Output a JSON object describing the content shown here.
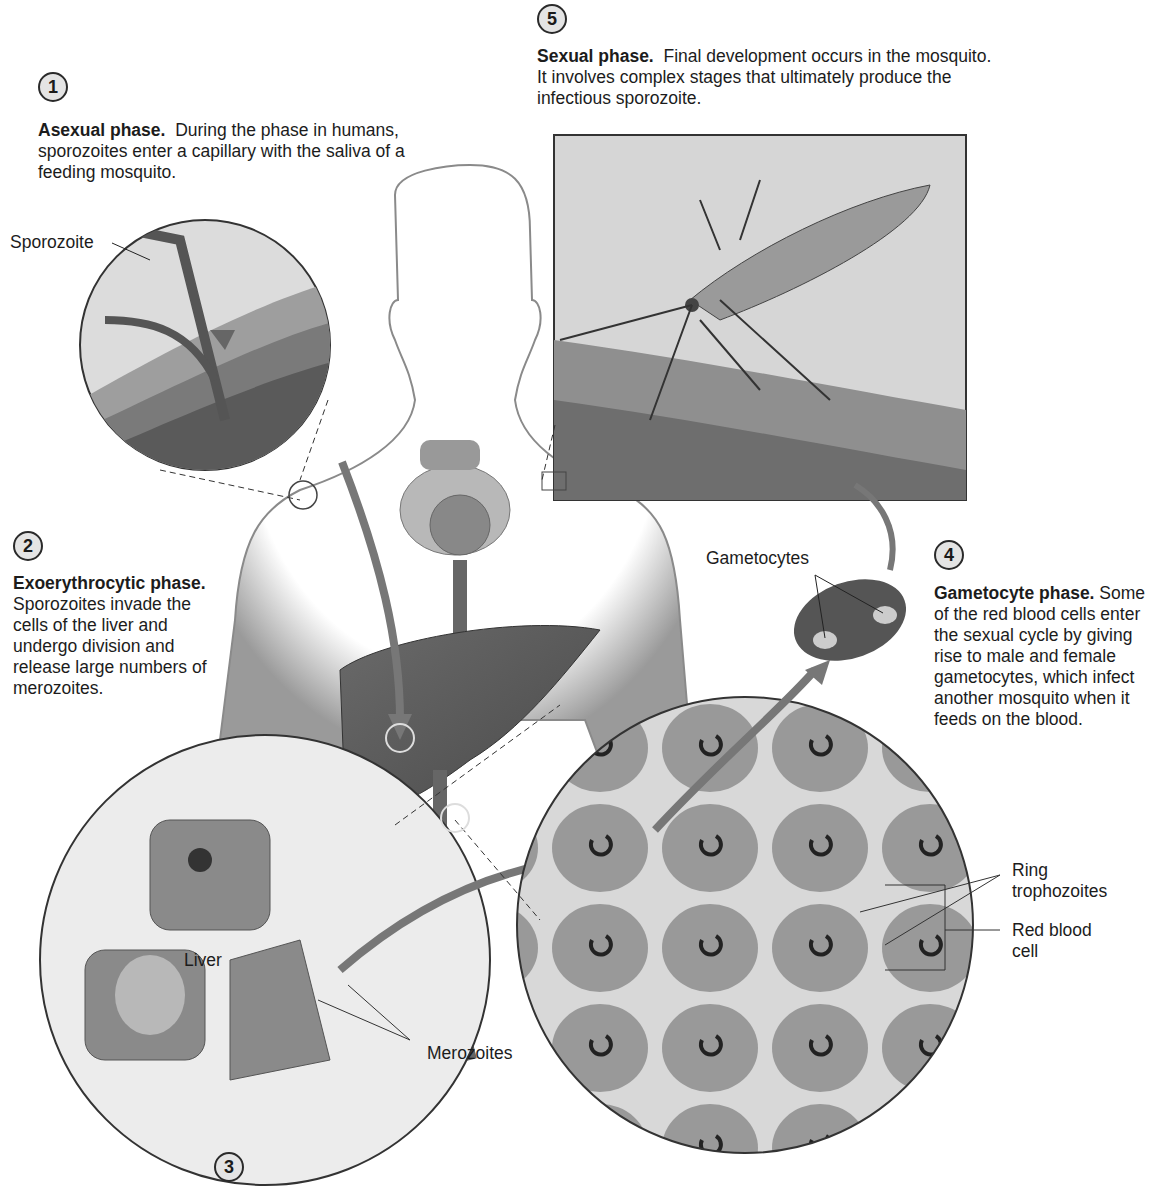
{
  "figure": {
    "steps": [
      {
        "number": "1",
        "heading": "Asexual phase.",
        "text": "During the phase in humans, sporozoites enter a capillary with the saliva of a feeding mosquito."
      },
      {
        "number": "2",
        "heading": "Exoerythrocytic phase.",
        "text": "Sporozoites invade the cells of the liver and undergo division and release large numbers of merozoites."
      },
      {
        "number": "3",
        "heading": "",
        "text": ""
      },
      {
        "number": "4",
        "heading": "Gametocyte phase.",
        "text": "Some of the red blood cells enter the sexual cycle by giving rise to male and female gametocytes, which infect another mosquito when it feeds on the blood."
      },
      {
        "number": "5",
        "heading": "Sexual phase.",
        "text": "Final development occurs in the mosquito. It involves complex stages that ultimately produce the infectious sporozoite."
      }
    ],
    "labels": {
      "sporozoite": "Sporozoite",
      "gametocytes": "Gametocytes",
      "liver": "Liver",
      "merozoites": "Merozoites",
      "ring_trophozoites": "Ring trophozoites",
      "red_blood_cell": "Red blood cell"
    },
    "colors": {
      "body_outline": "#6e6e6e",
      "tissue_gray": "#8a8a8a",
      "rbc_gray": "#9a9a9a",
      "badge_fill": "#e4e4e4"
    }
  }
}
